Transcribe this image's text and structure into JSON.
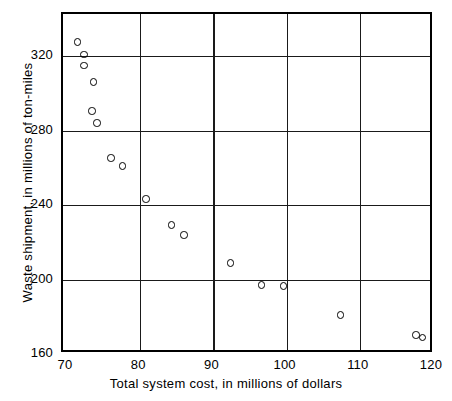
{
  "chart_data": {
    "type": "scatter",
    "title": "",
    "xlabel": "Total system cost, in millions of dollars",
    "ylabel": "Waste shipment, in millions of ton-miles",
    "xlim": [
      70,
      120
    ],
    "ylim": [
      160,
      340
    ],
    "xticks": [
      70,
      80,
      90,
      100,
      110,
      120
    ],
    "yticks": [
      160,
      200,
      240,
      280,
      320
    ],
    "xtick_labels": [
      "70",
      "80",
      "90",
      "100",
      "110",
      "120"
    ],
    "ytick_labels": [
      "160",
      "200",
      "240",
      "280",
      "320"
    ],
    "grid": true,
    "grid_lines_x": [
      80,
      90,
      100,
      110
    ],
    "grid_lines_y": [
      200,
      240,
      280,
      320
    ],
    "legend": null,
    "marker": "open-circle",
    "marker_color": "#000000",
    "points": [
      {
        "x": 71.4,
        "y": 327.5
      },
      {
        "x": 72.3,
        "y": 320.7
      },
      {
        "x": 72.3,
        "y": 315.0
      },
      {
        "x": 73.6,
        "y": 306.0
      },
      {
        "x": 73.4,
        "y": 290.5
      },
      {
        "x": 74.1,
        "y": 284.0
      },
      {
        "x": 76.0,
        "y": 265.2
      },
      {
        "x": 77.6,
        "y": 260.9
      },
      {
        "x": 80.8,
        "y": 243.2
      },
      {
        "x": 84.3,
        "y": 229.3
      },
      {
        "x": 86.0,
        "y": 223.9
      },
      {
        "x": 92.3,
        "y": 208.8
      },
      {
        "x": 96.6,
        "y": 197.0
      },
      {
        "x": 99.6,
        "y": 196.5
      },
      {
        "x": 107.4,
        "y": 180.9
      },
      {
        "x": 117.7,
        "y": 170.2
      },
      {
        "x": 118.6,
        "y": 169.0
      }
    ]
  },
  "colors": {
    "axis": "#000000",
    "grid": "#1a1a1a",
    "background": "#ffffff"
  }
}
